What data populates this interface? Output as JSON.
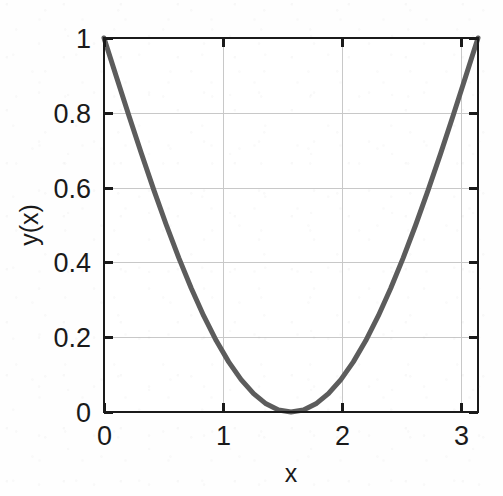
{
  "chart_data": {
    "type": "line",
    "title": "",
    "subtitle": "",
    "xlabel": "x",
    "ylabel": "y(x)",
    "xlim": [
      0,
      3.1416
    ],
    "ylim": [
      0,
      1
    ],
    "xticks": [
      0,
      1,
      2,
      3
    ],
    "xtick_labels": [
      "0",
      "1",
      "2",
      "3"
    ],
    "yticks": [
      0,
      0.2,
      0.4,
      0.6,
      0.8,
      1
    ],
    "ytick_labels": [
      "0",
      "0.2",
      "0.4",
      "0.6",
      "0.8",
      "1"
    ],
    "grid": true,
    "legend": null,
    "legend_position": "none",
    "series": [
      {
        "name": "y(x)",
        "expression": "1 - sin(x)",
        "color": "#5c5c5c",
        "line_width": 5,
        "x": [
          0,
          0.1047,
          0.2094,
          0.3142,
          0.4189,
          0.5236,
          0.6283,
          0.733,
          0.8378,
          0.9425,
          1.0472,
          1.1519,
          1.2566,
          1.3614,
          1.4661,
          1.5708,
          1.6755,
          1.7802,
          1.885,
          1.9897,
          2.0944,
          2.1991,
          2.3038,
          2.4086,
          2.5133,
          2.618,
          2.7227,
          2.8274,
          2.9322,
          3.0369,
          3.1416
        ],
        "values": [
          1.0,
          0.8955,
          0.7921,
          0.691,
          0.5931,
          0.5,
          0.4122,
          0.3308,
          0.2569,
          0.191,
          0.134,
          0.0866,
          0.049,
          0.0218,
          0.0055,
          0.0,
          0.0055,
          0.0218,
          0.049,
          0.0866,
          0.134,
          0.191,
          0.2569,
          0.3308,
          0.4122,
          0.5,
          0.5931,
          0.691,
          0.7921,
          0.8955,
          1.0
        ]
      }
    ],
    "annotations": []
  },
  "colors": {
    "curve": "#5c5c5c",
    "axis": "#1a1a1a",
    "grid": "#c8c8c8",
    "background": "#fefefe",
    "text": "#1a1a1a"
  },
  "axes": {
    "x_title": "x",
    "y_title": "y(x)"
  }
}
